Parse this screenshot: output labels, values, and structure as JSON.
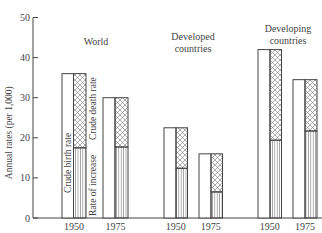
{
  "chart_data": {
    "type": "bar",
    "subtype": "stacked-split",
    "title": "",
    "xlabel": "",
    "ylabel": "Annual rates (per 1,000)",
    "ylim": [
      0,
      50
    ],
    "yticks": [
      0,
      10,
      20,
      30,
      40,
      50
    ],
    "grid": false,
    "groups": [
      {
        "name": "World",
        "label_lines": [
          "World"
        ],
        "years": [
          "1950",
          "1975"
        ]
      },
      {
        "name": "Developed countries",
        "label_lines": [
          "Developed",
          "countries"
        ],
        "years": [
          "1950",
          "1975"
        ]
      },
      {
        "name": "Developing countries",
        "label_lines": [
          "Developing",
          "countries"
        ],
        "years": [
          "1950",
          "1975"
        ]
      }
    ],
    "categories": [
      "World 1950",
      "World 1975",
      "Developed 1950",
      "Developed 1975",
      "Developing 1950",
      "Developing 1975"
    ],
    "series": [
      {
        "name": "Crude birth rate",
        "pattern": "none",
        "values": [
          36,
          30,
          22.5,
          16,
          42,
          34.5
        ]
      },
      {
        "name": "Crude death rate",
        "pattern": "crosshatch",
        "values": [
          18.5,
          12.3,
          10.1,
          9.5,
          22.6,
          12.8
        ]
      },
      {
        "name": "Rate of increase",
        "pattern": "vertical-lines",
        "values": [
          17.5,
          17.7,
          12.4,
          6.5,
          19.4,
          21.7
        ]
      }
    ],
    "annotations": [
      "Crude birth rate",
      "Crude death rate",
      "Rate of increase"
    ]
  },
  "labels": {
    "ylabel": "Annual rates (per 1,000)",
    "bar_text_birth": "Crude birth rate",
    "bar_text_death": "Crude death rate",
    "bar_text_increase": "Rate of increase"
  },
  "colors": {
    "ink": "#444444",
    "background": "#ffffff"
  }
}
